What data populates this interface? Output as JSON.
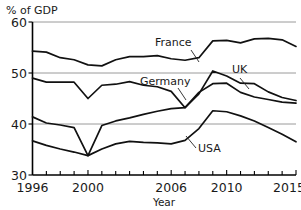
{
  "chart_data": {
    "type": "line",
    "title": "",
    "subtitle": "",
    "xlabel": "Year",
    "ylabel": "% of GDP",
    "xlim": [
      1996,
      2015
    ],
    "ylim": [
      30,
      60
    ],
    "yticks": [
      30,
      40,
      50,
      60
    ],
    "ytick_labels": [
      "30",
      "40",
      "50",
      "60"
    ],
    "xticks": [
      1996,
      1997,
      1998,
      1999,
      2000,
      2001,
      2002,
      2003,
      2004,
      2005,
      2006,
      2007,
      2008,
      2009,
      2010,
      2011,
      2012,
      2013,
      2014,
      2015
    ],
    "xtick_labels_shown": [
      "1996",
      "2000",
      "2006",
      "2010",
      "2015"
    ],
    "xtick_labels_shown_values": [
      1996,
      2000,
      2006,
      2010,
      2015
    ],
    "grid": "horizontal-only",
    "gridline_values": [
      40,
      50,
      60
    ],
    "legend": "inline-labels-with-leader-lines",
    "x": [
      1996,
      1997,
      1998,
      1999,
      2000,
      2001,
      2002,
      2003,
      2004,
      2005,
      2006,
      2007,
      2008,
      2009,
      2010,
      2011,
      2012,
      2013,
      2014,
      2015
    ],
    "series": [
      {
        "name": "France",
        "label": "France",
        "values": [
          54.3,
          54.1,
          53.0,
          52.6,
          51.6,
          51.4,
          52.6,
          53.2,
          53.2,
          53.4,
          52.8,
          52.5,
          53.0,
          56.3,
          56.4,
          55.9,
          56.7,
          56.8,
          56.5,
          55.2
        ]
      },
      {
        "name": "UK",
        "label": "UK",
        "values": [
          49.0,
          48.2,
          48.2,
          48.2,
          45.0,
          47.6,
          47.8,
          48.3,
          47.6,
          47.3,
          46.4,
          43.2,
          45.9,
          50.4,
          49.4,
          48.0,
          47.9,
          46.3,
          45.2,
          44.6
        ]
      },
      {
        "name": "Germany",
        "label": "Germany",
        "values": [
          41.4,
          40.2,
          39.8,
          39.3,
          33.8,
          39.7,
          40.6,
          41.2,
          41.9,
          42.5,
          43.0,
          43.2,
          46.2,
          47.9,
          48.0,
          46.2,
          45.3,
          44.8,
          44.3,
          44.1
        ]
      },
      {
        "name": "USA",
        "label": "USA",
        "values": [
          36.7,
          35.8,
          35.1,
          34.5,
          33.8,
          35.1,
          36.1,
          36.6,
          36.4,
          36.3,
          36.1,
          36.8,
          39.1,
          42.6,
          42.4,
          41.6,
          40.6,
          39.3,
          38.0,
          36.5
        ]
      }
    ],
    "annotations": [
      {
        "text": "France",
        "series": "France",
        "x": 2006.1,
        "y": 57.0
      },
      {
        "text": "UK",
        "series": "UK",
        "x": 2011.1,
        "y": 51.6
      },
      {
        "text": "Germany",
        "series": "Germany",
        "x": 2004.3,
        "y": 48.3
      },
      {
        "text": "USA",
        "series": "USA",
        "x": 2009.3,
        "y": 37.3
      }
    ]
  },
  "axes": {
    "ylabel": "% of GDP",
    "xlabel": "Year",
    "ytick_0": "30",
    "ytick_1": "40",
    "ytick_2": "50",
    "ytick_3": "60",
    "xtick_0": "1996",
    "xtick_1": "2000",
    "xtick_2": "2006",
    "xtick_3": "2010",
    "xtick_4": "2015"
  },
  "labels": {
    "france": "France",
    "uk": "UK",
    "germany": "Germany",
    "usa": "USA"
  },
  "colors": {
    "line": "#111111",
    "gridline": "#9a9a9a",
    "axis": "#000000",
    "background": "#ffffff"
  }
}
